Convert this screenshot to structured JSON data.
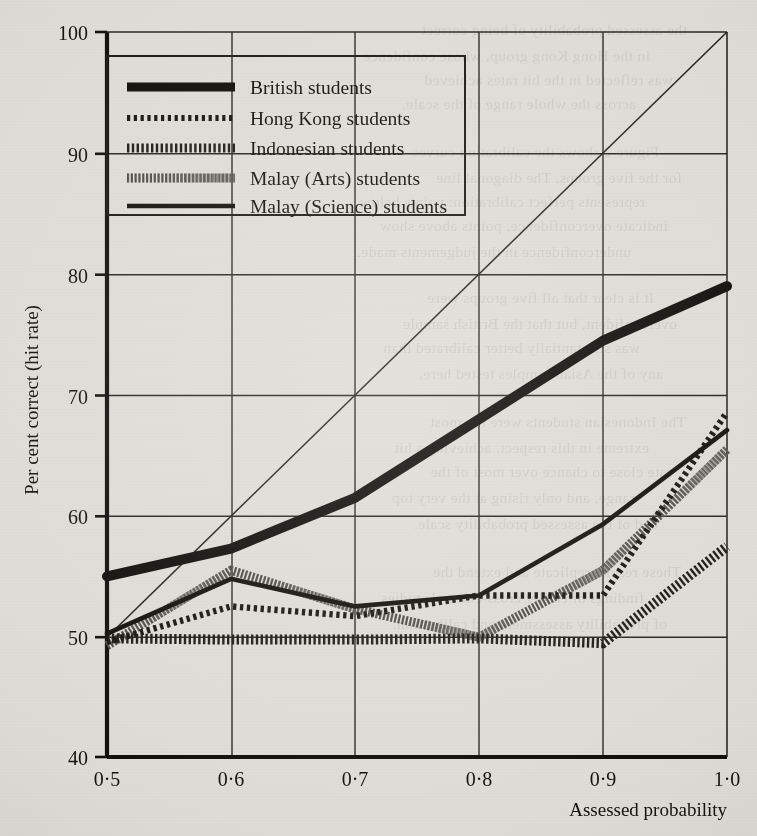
{
  "chart_data": {
    "type": "line",
    "title": "",
    "xlabel": "Assessed probability",
    "ylabel": "Per cent correct (hit rate)",
    "xlim": [
      0.5,
      1.0
    ],
    "ylim": [
      40,
      100
    ],
    "grid": true,
    "legend_position": "top-left",
    "x": [
      0.5,
      0.6,
      0.7,
      0.8,
      0.9,
      1.0
    ],
    "x_tick_labels": [
      "0·5",
      "0·6",
      "0·7",
      "0·8",
      "0·9",
      "1·0"
    ],
    "y_ticks": [
      40,
      50,
      60,
      70,
      80,
      90,
      100
    ],
    "y_tick_labels": [
      "40",
      "50",
      "60",
      "70",
      "80",
      "90",
      "100"
    ],
    "reference_line": {
      "name": "perfect calibration diagonal",
      "from": [
        0.5,
        50
      ],
      "to": [
        1.0,
        100
      ]
    },
    "series": [
      {
        "name": "British students",
        "style": "thick-solid",
        "color": "#121212",
        "values": [
          55.0,
          57.3,
          61.5,
          68.0,
          74.5,
          79.0
        ]
      },
      {
        "name": "Hong Kong students",
        "style": "fine-dotted",
        "color": "#1a1a1a",
        "values": [
          49.6,
          52.5,
          51.7,
          53.4,
          53.4,
          68.5
        ]
      },
      {
        "name": "Indonesian students",
        "style": "dense-hatched",
        "color": "#1e1e1e",
        "values": [
          49.9,
          49.8,
          49.8,
          49.9,
          49.5,
          57.5
        ]
      },
      {
        "name": "Malay (Arts) students",
        "style": "grey-hatched",
        "color": "#5e5e5e",
        "values": [
          49.3,
          55.5,
          52.3,
          50.0,
          55.5,
          65.5
        ]
      },
      {
        "name": "Malay (Science) students",
        "style": "thin-solid",
        "color": "#141414",
        "values": [
          50.3,
          54.8,
          52.5,
          53.4,
          59.3,
          67.0
        ]
      }
    ]
  },
  "legend": {
    "items": [
      {
        "label": "British students"
      },
      {
        "label": "Hong Kong students"
      },
      {
        "label": "Indonesian students"
      },
      {
        "label": "Malay (Arts) students"
      },
      {
        "label": "Malay (Science) students"
      }
    ]
  },
  "page_bleed": {
    "lines": [
      "the assessed probability of being correct",
      "in the Hong Kong group, whose confidence",
      "was reflected in the hit rates achieved",
      "across the whole range of the scale.",
      "Figure 2 shows the calibration curves",
      "for the five groups. The diagonal line",
      "represents perfect calibration: points below",
      "indicate overconfidence, points above show",
      "underconfidence in the judgements made.",
      "It is clear that all five groups were",
      "overconfident, but that the British sample",
      "was substantially better calibrated than",
      "any of the Asian samples tested here.",
      "The Indonesian students were the most",
      "extreme in this respect, achieving a hit",
      "rate close to chance over most of the",
      "range, and only rising at the very top",
      "end of the assessed probability scale.",
      "These results replicate and extend the",
      "findings of earlier cross-cultural studies",
      "of probability assessment and calibration."
    ]
  }
}
